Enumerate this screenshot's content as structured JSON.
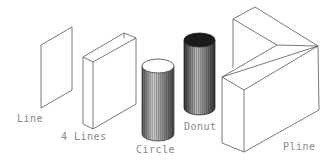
{
  "diagram": {
    "objects": [
      {
        "id": "line",
        "label": "Line",
        "shape": "extruded single line (plane)"
      },
      {
        "id": "four-lines",
        "label": "4 Lines",
        "shape": "open box from 4 extruded lines"
      },
      {
        "id": "circle",
        "label": "Circle",
        "shape": "cylinder with solid top"
      },
      {
        "id": "donut",
        "label": "Donut",
        "shape": "hollow cylinder (dark top)"
      },
      {
        "id": "pline",
        "label": "Pline",
        "shape": "L-shaped extruded polyline wall"
      }
    ],
    "colors": {
      "background": "#ffffff",
      "edge": "#555555",
      "label": "#888888",
      "donut_top": "#1a1a1a"
    }
  }
}
